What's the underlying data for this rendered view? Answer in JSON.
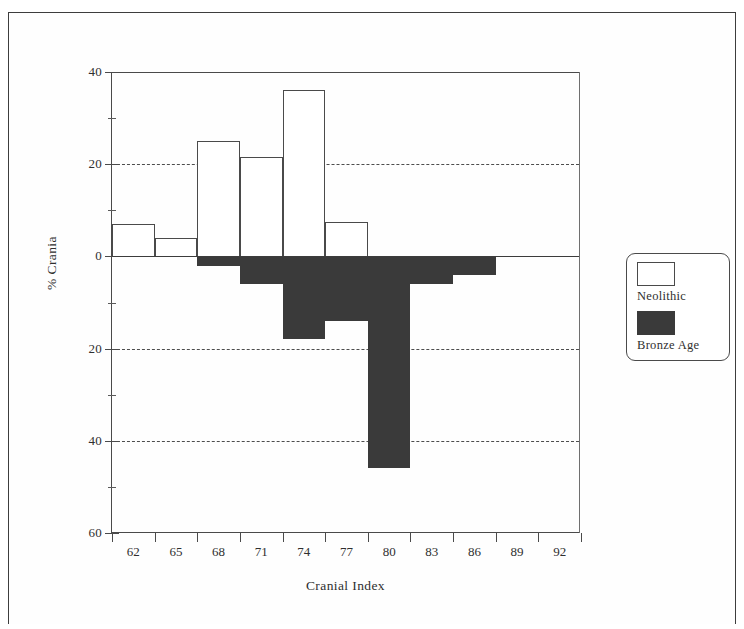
{
  "chart_data": {
    "type": "bar",
    "title": "",
    "xlabel": "Cranial Index",
    "ylabel": "% Crania",
    "categories": [
      "62",
      "65",
      "68",
      "71",
      "74",
      "77",
      "80",
      "83",
      "86",
      "89",
      "92"
    ],
    "series": [
      {
        "name": "Neolithic",
        "direction": "up",
        "color": "#ffffff",
        "values": [
          7,
          4,
          25,
          21.5,
          36,
          7.5,
          0,
          0,
          0,
          0,
          0
        ]
      },
      {
        "name": "Bronze Age",
        "direction": "down",
        "color": "#3a3a3a",
        "values": [
          0,
          0,
          2,
          6,
          18,
          14,
          46,
          6,
          4,
          0,
          0
        ]
      }
    ],
    "yaxis": {
      "ticks": [
        {
          "value": 40,
          "label": "40"
        },
        {
          "value": 20,
          "label": "20"
        },
        {
          "value": 0,
          "label": "0"
        },
        {
          "value": -20,
          "label": "20"
        },
        {
          "value": -40,
          "label": "40"
        },
        {
          "value": -60,
          "label": "60"
        }
      ],
      "minor_ticks": [
        30,
        10,
        -10,
        -30,
        -50
      ],
      "ylim": [
        -60,
        40
      ],
      "gridlines": [
        20,
        -20,
        -40
      ]
    },
    "xaxis": {
      "tick_labels": [
        "62",
        "65",
        "68",
        "71",
        "74",
        "77",
        "80",
        "83",
        "86",
        "89",
        "92"
      ]
    },
    "legend": {
      "position": "right",
      "entries": [
        {
          "label": "Neolithic",
          "swatch": "hollow"
        },
        {
          "label": "Bronze Age",
          "swatch": "filled"
        }
      ]
    }
  }
}
